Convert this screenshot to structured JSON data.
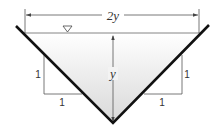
{
  "diagram": {
    "labels": {
      "top_width": "2y",
      "depth": "y",
      "left_slope_rise": "1",
      "left_slope_run": "1",
      "right_slope_rise": "1",
      "right_slope_run": "1"
    },
    "symbols": {
      "water_surface": "water-surface-triangle"
    },
    "colors": {
      "channel_wall": "#111111",
      "water_fill_top": "#ffffff",
      "water_fill_bottom": "#d8d8d8",
      "dimension_lines": "#555555"
    }
  }
}
